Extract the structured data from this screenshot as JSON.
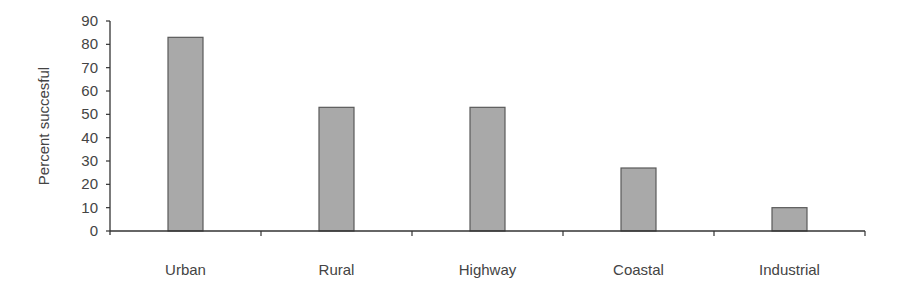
{
  "chart_data": {
    "type": "bar",
    "title": "",
    "xlabel": "",
    "ylabel": "Percent succesful",
    "categories": [
      "Urban",
      "Rural",
      "Highway",
      "Coastal",
      "Industrial"
    ],
    "values": [
      83,
      53,
      53,
      27,
      10
    ],
    "ylim": [
      0,
      90
    ],
    "yticks": [
      0,
      10,
      20,
      30,
      40,
      50,
      60,
      70,
      80,
      90
    ],
    "grid": false,
    "legend": null,
    "colors": {
      "bar_fill": "#a9a9a9",
      "bar_stroke": "#5a5a5a",
      "axis": "#333333",
      "text": "#444444"
    }
  }
}
